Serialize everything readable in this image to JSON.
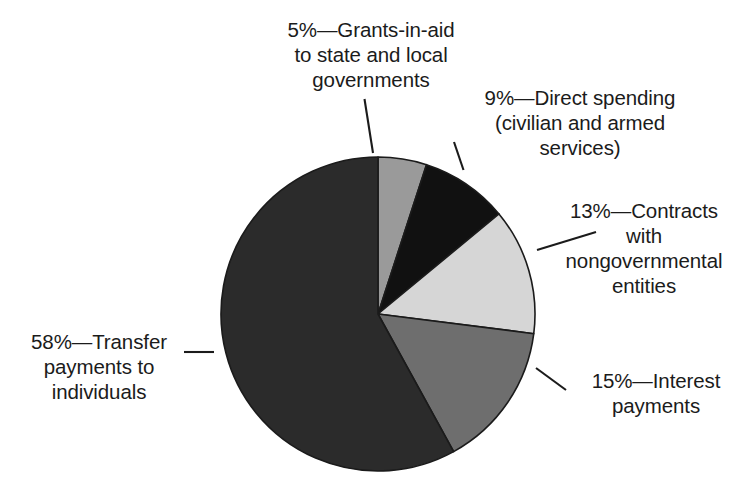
{
  "chart_data": {
    "type": "pie",
    "title": "",
    "subtitle": "",
    "xlabel": "",
    "ylabel": "",
    "legend_position": "none",
    "grid": false,
    "units": "percent",
    "start_angle_deg": 0,
    "direction": "clockwise",
    "categories": [
      "Grants-in-aid to state and local governments",
      "Direct spending (civilian and armed services)",
      "Contracts with nongovernmental entities",
      "Interest payments",
      "Transfer payments to individuals"
    ],
    "values": [
      5,
      9,
      13,
      15,
      58
    ],
    "slices": [
      {
        "percent": 5,
        "percent_label": "5%",
        "label": "5%—Grants-in-aid\nto state and local\ngovernments",
        "name": "grants-in-aid",
        "color": "#9a9a9a",
        "start_deg": 0,
        "end_deg": 18
      },
      {
        "percent": 9,
        "percent_label": "9%",
        "label": "9%—Direct spending\n(civilian and armed\nservices)",
        "name": "direct-spending",
        "color": "#111111",
        "start_deg": 18,
        "end_deg": 50.4
      },
      {
        "percent": 13,
        "percent_label": "13%",
        "label": "13%—Contracts\nwith\nnongovernmental\nentities",
        "name": "contracts",
        "color": "#d6d6d6",
        "start_deg": 50.4,
        "end_deg": 97.2
      },
      {
        "percent": 15,
        "percent_label": "15%",
        "label": "15%—Interest\npayments",
        "name": "interest-payments",
        "color": "#6e6e6e",
        "start_deg": 97.2,
        "end_deg": 151.2
      },
      {
        "percent": 58,
        "percent_label": "58%",
        "label": "58%—Transfer\npayments to\nindividuals",
        "name": "transfer-payments",
        "color": "#2b2b2b",
        "start_deg": 151.2,
        "end_deg": 360
      }
    ],
    "geometry": {
      "center_x": 378,
      "center_y": 314,
      "radius": 157
    },
    "colors": {
      "background": "#ffffff",
      "outline": "#1b1b1b",
      "text": "#1b1b1b"
    }
  }
}
